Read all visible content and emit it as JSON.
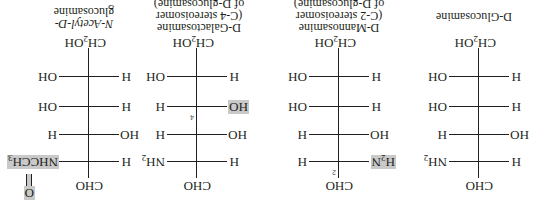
{
  "figure": {
    "orientation": "rotated-180",
    "highlight_color": "#c9c9c9",
    "compounds": [
      {
        "name": "D-Glucosamine",
        "label_lines": [
          "D-Glucosamine"
        ],
        "top": "CHO",
        "rows": [
          {
            "left": "H",
            "right": "NH2",
            "carbon": "C-2"
          },
          {
            "left": "HO",
            "right": "H",
            "carbon": "C-3"
          },
          {
            "left": "H",
            "right": "OH",
            "carbon": "C-4"
          },
          {
            "left": "H",
            "right": "OH",
            "carbon": "C-5"
          }
        ],
        "bottom": "CH2OH"
      },
      {
        "name": "D-Mannosamine",
        "label_lines": [
          "D-Mannosamine",
          "(C-2 stereoisomer",
          "of D-glucosamine)"
        ],
        "top": "CHO",
        "rows": [
          {
            "left": "H2N",
            "right": "H",
            "carbon": "C-2",
            "highlight": "left",
            "number": "2"
          },
          {
            "left": "HO",
            "right": "H",
            "carbon": "C-3"
          },
          {
            "left": "H",
            "right": "OH",
            "carbon": "C-4"
          },
          {
            "left": "H",
            "right": "OH",
            "carbon": "C-5"
          }
        ],
        "bottom": "CH2OH"
      },
      {
        "name": "D-Galactosamine",
        "label_lines": [
          "D-Galactosamine",
          "(C-4 stereoisomer",
          "of D-glucosamine)"
        ],
        "top": "CHO",
        "rows": [
          {
            "left": "H",
            "right": "NH2",
            "carbon": "C-2"
          },
          {
            "left": "HO",
            "right": "H",
            "carbon": "C-3"
          },
          {
            "left": "HO",
            "right": "H",
            "carbon": "C-4",
            "highlight": "left",
            "number": "4"
          },
          {
            "left": "H",
            "right": "OH",
            "carbon": "C-5"
          }
        ],
        "bottom": "CH2OH"
      },
      {
        "name": "N-Acetyl-D-glucosamine",
        "label_lines": [
          "N-Acetyl-D-",
          "glucosamine"
        ],
        "top": "CHO",
        "rows": [
          {
            "left": "H",
            "right": "NHCCH3",
            "carbon": "C-2",
            "highlight": "right",
            "carbonyl": "O"
          },
          {
            "left": "HO",
            "right": "H",
            "carbon": "C-3"
          },
          {
            "left": "H",
            "right": "OH",
            "carbon": "C-4"
          },
          {
            "left": "H",
            "right": "OH",
            "carbon": "C-5"
          }
        ],
        "bottom": "CH2OH"
      }
    ]
  }
}
